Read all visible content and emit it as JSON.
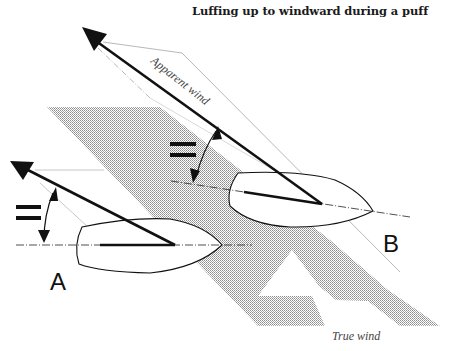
{
  "title": "Luffing up to windward during a puff",
  "labels": {
    "apparent_wind": "Apparent wind",
    "true_wind": "True wind",
    "boat_a": "A",
    "boat_b": "B",
    "equal_sign": "="
  },
  "colors": {
    "ink": "#111111",
    "shade": "#bdbdbd",
    "thin_line": "#9a9a9a",
    "text_grey": "#444444"
  }
}
